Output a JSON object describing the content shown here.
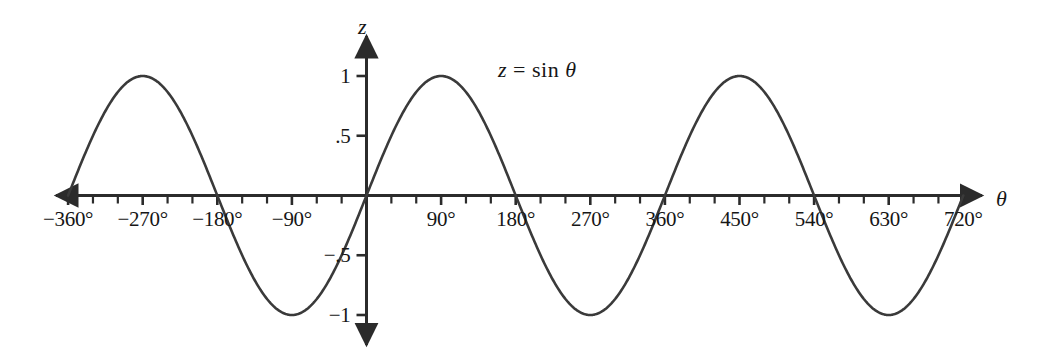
{
  "figure": {
    "background_color": "#ffffff",
    "ink_color": "#2b2b2b",
    "text_color": "#161616",
    "width": 1040,
    "height": 361
  },
  "annotations": {
    "equation": "z = sin θ",
    "equation_lhs": "z",
    "equation_operator": "=",
    "equation_function": "sin",
    "equation_variable": "θ",
    "x_axis_name": "θ",
    "y_axis_name": "z"
  },
  "chart_data": {
    "type": "line",
    "title": "",
    "subtitle": "",
    "xlabel": "θ",
    "ylabel": "z",
    "legend": [],
    "legend_position": "none",
    "grid": false,
    "annotation_text": "z = sin θ",
    "xlim": [
      -390,
      760
    ],
    "ylim": [
      -1.12,
      1.12
    ],
    "x_major_ticks": [
      -360,
      -270,
      -180,
      -90,
      0,
      90,
      180,
      270,
      360,
      450,
      540,
      630,
      720
    ],
    "x_minor_tick_step": 30,
    "x_tick_labels": [
      "−360°",
      "−270°",
      "−180°",
      "−90°",
      "",
      "90°",
      "180°",
      "270°",
      "360°",
      "450°",
      "540°",
      "630°",
      "720°"
    ],
    "y_ticks": [
      1,
      0.5,
      -0.5,
      -1
    ],
    "y_tick_labels": [
      "1",
      ".5",
      "−.5",
      "−1"
    ],
    "series": [
      {
        "name": "z = sin θ",
        "function": "sin",
        "amplitude": 1,
        "period_degrees": 360,
        "phase_degrees": 0,
        "x_start": -360,
        "x_end": 720,
        "x": [
          -360,
          -330,
          -300,
          -270,
          -240,
          -210,
          -180,
          -150,
          -120,
          -90,
          -60,
          -30,
          0,
          30,
          60,
          90,
          120,
          150,
          180,
          210,
          240,
          270,
          300,
          330,
          360,
          390,
          420,
          450,
          480,
          510,
          540,
          570,
          600,
          630,
          660,
          690,
          720
        ],
        "values": [
          0,
          0.5,
          0.866,
          1,
          0.866,
          0.5,
          0,
          -0.5,
          -0.866,
          -1,
          -0.866,
          -0.5,
          0,
          0.5,
          0.866,
          1,
          0.866,
          0.5,
          0,
          -0.5,
          -0.866,
          -1,
          -0.866,
          -0.5,
          0,
          0.5,
          0.866,
          1,
          0.866,
          0.5,
          0,
          -0.5,
          -0.866,
          -1,
          -0.866,
          -0.5,
          0
        ]
      }
    ],
    "key_points": {
      "maxima_degrees": [
        -270,
        90,
        450
      ],
      "minima_degrees": [
        -90,
        270,
        630
      ],
      "zeros_degrees": [
        -360,
        -180,
        0,
        180,
        360,
        540,
        720
      ]
    }
  },
  "axes": {
    "x_arrow_left": true,
    "x_arrow_right": true,
    "y_arrow_up": true,
    "y_arrow_down": true
  }
}
